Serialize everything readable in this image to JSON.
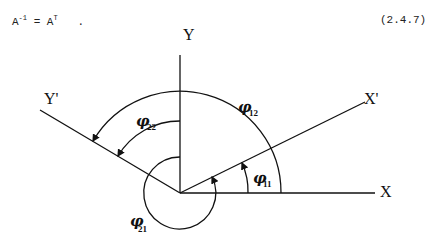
{
  "equation": {
    "lhs_base": "A",
    "lhs_sup": "-1",
    "equals": "=",
    "rhs_base": "A",
    "rhs_sup": "T",
    "punct": ".",
    "number": "(2.4.7)"
  },
  "diagram": {
    "axes": {
      "x": "X",
      "y": "Y",
      "x_prime": "X'",
      "y_prime": "Y'"
    },
    "angles": [
      {
        "symbol": "φ",
        "sub": "11"
      },
      {
        "symbol": "φ",
        "sub": "12"
      },
      {
        "symbol": "φ",
        "sub": "21"
      },
      {
        "symbol": "φ",
        "sub": "22"
      }
    ]
  }
}
